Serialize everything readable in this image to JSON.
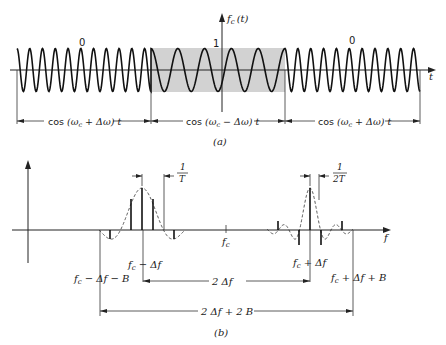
{
  "figure": {
    "panel_a": {
      "caption": "(a)",
      "y_axis_label": "f_c (t)",
      "x_axis_label": "t",
      "amplitude_label": "1",
      "segment_bits": [
        "0",
        "1",
        "0"
      ],
      "segments": [
        {
          "label": "cos (ω_c + Δω) t",
          "bit": "0",
          "frequency": "high"
        },
        {
          "label": "cos (ω_c − Δω) t",
          "bit": "1",
          "frequency": "low",
          "shaded": true
        },
        {
          "label": "cos (ω_c + Δω) t",
          "bit": "0",
          "frequency": "high"
        }
      ],
      "shade_color": "#d4d4d4"
    },
    "panel_b": {
      "caption": "(b)",
      "x_axis_label": "f",
      "center_label": "f_c",
      "left_lobe": {
        "center_label": "f_c − Δf",
        "edge_label": "f_c − Δf − B",
        "spacing_label_num": "1",
        "spacing_label_den": "T"
      },
      "right_lobe": {
        "center_label": "f_c + Δf",
        "edge_label": "f_c + Δf + B",
        "spacing_label_num": "1",
        "spacing_label_den": "2T"
      },
      "dimension_labels": {
        "inner": "2 Δf",
        "outer": "2 Δf + 2 B"
      }
    }
  },
  "text": {
    "a_bit0_left": "0",
    "a_bit1": "1",
    "a_bit0_right": "0",
    "a_fc_t_f": "f",
    "a_fc_t_sub": "c",
    "a_fc_t_arg": "(t)",
    "a_t": "t",
    "a_seg1_cos": "cos",
    "a_seg1_arg": "(ω",
    "a_seg1_rest": " + Δω) t",
    "a_seg2_cos": "cos",
    "a_seg2_arg": "(ω",
    "a_seg2_rest": " − Δω) t",
    "a_seg3_cos": "cos",
    "a_seg3_arg": "(ω",
    "a_seg3_rest": " + Δω) t",
    "sub_c": "c",
    "a_caption": "(a)",
    "b_caption": "(b)",
    "b_f": "f",
    "b_fc_f": "f",
    "b_fc_sub": "c",
    "b_1": "1",
    "b_T": "T",
    "b_1b": "1",
    "b_2T": "2T",
    "b_left_center_rest": " − Δf",
    "b_left_edge_rest": " − Δf − B",
    "b_right_center_rest": " + Δf",
    "b_right_edge_rest": " + Δf + B",
    "b_inner": "2 Δf",
    "b_outer": "2 Δf + 2 B"
  }
}
